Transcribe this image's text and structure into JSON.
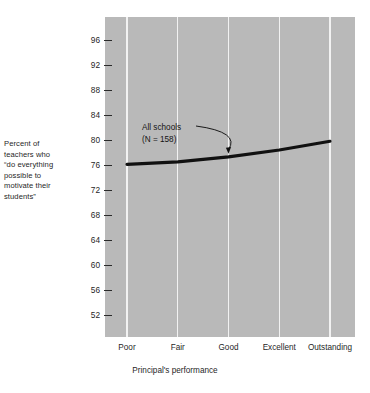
{
  "chart_data": {
    "type": "line",
    "title": "",
    "subtitle": "",
    "xlabel": "Principal's performance",
    "ylabel": "Percent of teachers who “do everything possible to motivate their students”",
    "categories": [
      "Poor",
      "Fair",
      "Good",
      "Excellent",
      "Outstanding"
    ],
    "series": [
      {
        "name": "All schools",
        "values": [
          76.1,
          76.5,
          77.3,
          78.4,
          79.8
        ]
      }
    ],
    "ylim": [
      50,
      98
    ],
    "yticks": [
      52,
      56,
      60,
      64,
      68,
      72,
      76,
      80,
      84,
      88,
      92,
      96
    ],
    "ytick_labels": [
      "52",
      "56",
      "60",
      "64",
      "68",
      "72",
      "76",
      "80",
      "84",
      "88",
      "92",
      "96"
    ],
    "grid": "vertical",
    "legend": "none",
    "annotations": [
      {
        "text_line1": "All schools",
        "text_line2": "(N = 158)",
        "points_to_category": "Good",
        "points_to_value": 77.3,
        "arrow": "curved"
      }
    ],
    "colors": {
      "plot_background": "#b9b9b9",
      "gridline": "#f2f2f2",
      "series_line": "#111111",
      "text": "#1f1f1f",
      "page_background": "#ffffff"
    }
  },
  "axis_title_y": {
    "line1": "Percent of",
    "line2": "teachers who",
    "line3": "“do everything",
    "line4": "possible to",
    "line5": "motivate their",
    "line6": "students”"
  },
  "annotation": {
    "line1": "All schools",
    "line2": "(N = 158)"
  }
}
